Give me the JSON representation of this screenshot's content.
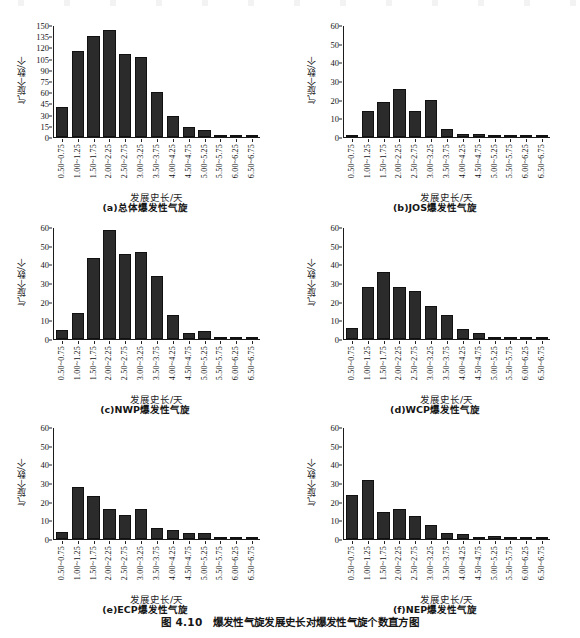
{
  "figure": {
    "caption": "图 4.10　爆发性气旋发展史长对爆发性气旋个数直方图",
    "xlabel": "发展史长/天",
    "ylabel": "气旋个数/个",
    "categories": [
      "0.50~0.75",
      "1.00~1.25",
      "1.50~1.75",
      "2.00~2.25",
      "2.50~2.75",
      "3.00~3.25",
      "3.50~3.75",
      "4.00~4.25",
      "4.50~4.75",
      "5.00~5.25",
      "5.50~5.75",
      "6.00~6.25",
      "6.50~6.75"
    ],
    "bar_color": "#2b2b2b"
  },
  "chart_data": [
    {
      "type": "bar",
      "id": "a",
      "title": "(a)总体爆发性气旋",
      "xlabel": "发展史长/天",
      "ylabel": "气旋个数/个",
      "categories": [
        "0.50~0.75",
        "1.00~1.25",
        "1.50~1.75",
        "2.00~2.25",
        "2.50~2.75",
        "3.00~3.25",
        "3.50~3.75",
        "4.00~4.25",
        "4.50~4.75",
        "5.00~5.25",
        "5.50~5.75",
        "6.00~6.25",
        "6.50~6.75"
      ],
      "values": [
        40,
        116,
        136,
        145,
        112,
        108,
        61,
        28,
        13,
        10,
        1,
        2,
        1
      ],
      "ylim": [
        0,
        150
      ],
      "yticks": [
        0,
        15,
        30,
        45,
        60,
        75,
        90,
        105,
        120,
        135,
        150
      ],
      "grid": false,
      "legend": "none"
    },
    {
      "type": "bar",
      "id": "b",
      "title": "(b)JOS爆发性气旋",
      "xlabel": "发展史长/天",
      "ylabel": "气旋个数/个",
      "categories": [
        "0.50~0.75",
        "1.00~1.25",
        "1.50~1.75",
        "2.00~2.25",
        "2.50~2.75",
        "3.00~3.25",
        "3.50~3.75",
        "4.00~4.25",
        "4.50~4.75",
        "5.00~5.25",
        "5.50~5.75",
        "6.00~6.25",
        "6.50~6.75"
      ],
      "values": [
        1,
        14,
        19,
        26,
        14,
        20,
        4.5,
        1.5,
        1.5,
        0,
        0,
        0,
        0
      ],
      "ylim": [
        0,
        60
      ],
      "yticks": [
        0,
        10,
        20,
        30,
        40,
        50,
        60
      ],
      "grid": false,
      "legend": "none"
    },
    {
      "type": "bar",
      "id": "c",
      "title": "(c)NWP爆发性气旋",
      "xlabel": "发展史长/天",
      "ylabel": "气旋个数/个",
      "categories": [
        "0.50~0.75",
        "1.00~1.25",
        "1.50~1.75",
        "2.00~2.25",
        "2.50~2.75",
        "3.00~3.25",
        "3.50~3.75",
        "4.00~4.25",
        "4.50~4.75",
        "5.00~5.25",
        "5.50~5.75",
        "6.00~6.25",
        "6.50~6.75"
      ],
      "values": [
        5,
        14,
        44,
        59,
        46,
        47,
        34,
        13,
        3.5,
        4.5,
        0.5,
        0.5,
        0.5
      ],
      "ylim": [
        0,
        60
      ],
      "yticks": [
        0,
        10,
        20,
        30,
        40,
        50,
        60
      ],
      "grid": false,
      "legend": "none"
    },
    {
      "type": "bar",
      "id": "d",
      "title": "(d)WCP爆发性气旋",
      "xlabel": "发展史长/天",
      "ylabel": "气旋个数/个",
      "categories": [
        "0.50~0.75",
        "1.00~1.25",
        "1.50~1.75",
        "2.00~2.25",
        "2.50~2.75",
        "3.00~3.25",
        "3.50~3.75",
        "4.00~4.25",
        "4.50~4.75",
        "5.00~5.25",
        "5.50~5.75",
        "6.00~6.25",
        "6.50~6.75"
      ],
      "values": [
        6,
        28,
        36,
        28,
        26,
        18,
        13,
        5.5,
        3.5,
        1,
        0,
        0,
        0
      ],
      "ylim": [
        0,
        60
      ],
      "yticks": [
        0,
        10,
        20,
        30,
        40,
        50,
        60
      ],
      "grid": false,
      "legend": "none"
    },
    {
      "type": "bar",
      "id": "e",
      "title": "(e)ECP爆发性气旋",
      "xlabel": "发展史长/天",
      "ylabel": "气旋个数/个",
      "categories": [
        "0.50~0.75",
        "1.00~1.25",
        "1.50~1.75",
        "2.00~2.25",
        "2.50~2.75",
        "3.00~3.25",
        "3.50~3.75",
        "4.00~4.25",
        "4.50~4.75",
        "5.00~5.25",
        "5.50~5.75",
        "6.00~6.25",
        "6.50~6.75"
      ],
      "values": [
        4,
        28,
        23,
        16,
        13,
        16,
        6,
        5,
        3.5,
        3.5,
        0,
        0,
        0.5
      ],
      "ylim": [
        0,
        60
      ],
      "yticks": [
        0,
        10,
        20,
        30,
        40,
        50,
        60
      ],
      "grid": false,
      "legend": "none"
    },
    {
      "type": "bar",
      "id": "f",
      "title": "(f)NEP爆发性气旋",
      "xlabel": "发展史长/天",
      "ylabel": "气旋个数/个",
      "categories": [
        "0.50~0.75",
        "1.00~1.25",
        "1.50~1.75",
        "2.00~2.25",
        "2.50~2.75",
        "3.00~3.25",
        "3.50~3.75",
        "4.00~4.25",
        "4.50~4.75",
        "5.00~5.25",
        "5.50~5.75",
        "6.00~6.25",
        "6.50~6.75"
      ],
      "values": [
        24,
        32,
        14.5,
        16,
        12.5,
        7.5,
        3,
        2.5,
        0,
        1.5,
        0.5,
        1,
        0
      ],
      "ylim": [
        0,
        60
      ],
      "yticks": [
        0,
        10,
        20,
        30,
        40,
        50,
        60
      ],
      "grid": false,
      "legend": "none"
    }
  ]
}
